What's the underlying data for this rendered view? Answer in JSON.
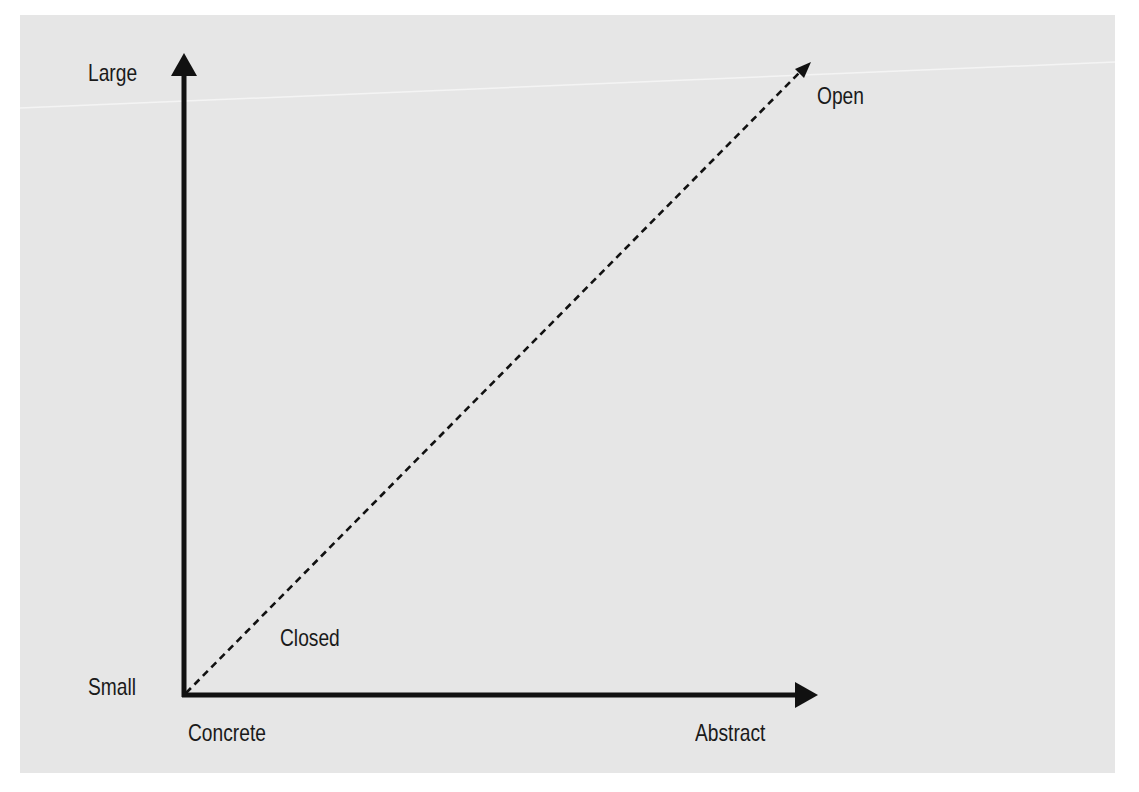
{
  "figure": {
    "heading_partial": "",
    "background_color": "#e6e6e6",
    "axis_color": "#111111",
    "diagonal_style": "dashed"
  },
  "axes": {
    "y_axis": {
      "top_label": "Large",
      "bottom_label": "Small"
    },
    "x_axis": {
      "left_label": "Concrete",
      "right_label": "Abstract"
    }
  },
  "diagonal": {
    "start_label": "Closed",
    "end_label": "Open"
  }
}
